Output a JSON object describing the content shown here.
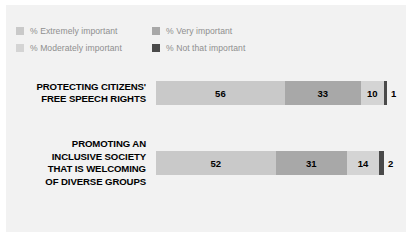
{
  "panel": {
    "background_color": "#f2f2f2"
  },
  "legend": {
    "rows": [
      [
        {
          "label": "% Extremely important",
          "color": "#c9c9c9",
          "swatch_name": "legend-swatch-extremely-important"
        },
        {
          "label": "% Very important",
          "color": "#a8a8a8",
          "swatch_name": "legend-swatch-very-important"
        }
      ],
      [
        {
          "label": "% Moderately important",
          "color": "#d4d4d4",
          "swatch_name": "legend-swatch-moderately-important"
        },
        {
          "label": "% Not that important",
          "color": "#4a4a4a",
          "swatch_name": "legend-swatch-not-that-important"
        }
      ]
    ]
  },
  "chart_data": {
    "type": "bar",
    "orientation": "horizontal",
    "stacked": true,
    "percent_scale": true,
    "title": "",
    "subtitle": "",
    "xlabel": "",
    "ylabel": "",
    "xlim": [
      0,
      100
    ],
    "grid": false,
    "legend_position": "top-left",
    "categories": [
      "PROTECTING CITIZENS' FREE SPEECH RIGHTS",
      "PROMOTING AN INCLUSIVE SOCIETY THAT IS WELCOMING OF DIVERSE GROUPS"
    ],
    "series": [
      {
        "name": "% Extremely important",
        "color": "#c9c9c9",
        "values": [
          56,
          52
        ]
      },
      {
        "name": "% Very important",
        "color": "#a8a8a8",
        "values": [
          33,
          31
        ]
      },
      {
        "name": "% Moderately important",
        "color": "#d4d4d4",
        "values": [
          10,
          14
        ]
      },
      {
        "name": "% Not that important",
        "color": "#4a4a4a",
        "values": [
          1,
          2
        ]
      }
    ]
  },
  "bars": [
    {
      "label_lines": [
        "PROTECTING CITIZENS'",
        "FREE SPEECH RIGHTS"
      ],
      "segments": [
        {
          "value": 56,
          "label": "56",
          "color": "#c9c9c9",
          "series": "% Extremely important"
        },
        {
          "value": 33,
          "label": "33",
          "color": "#a8a8a8",
          "series": "% Very important"
        },
        {
          "value": 10,
          "label": "10",
          "color": "#d4d4d4",
          "series": "% Moderately important"
        },
        {
          "value": 1,
          "label": "1",
          "color": "#4a4a4a",
          "series": "% Not that important"
        }
      ]
    },
    {
      "label_lines": [
        "PROMOTING AN",
        "INCLUSIVE SOCIETY",
        "THAT IS WELCOMING",
        "OF DIVERSE GROUPS"
      ],
      "segments": [
        {
          "value": 52,
          "label": "52",
          "color": "#c9c9c9",
          "series": "% Extremely important"
        },
        {
          "value": 31,
          "label": "31",
          "color": "#a8a8a8",
          "series": "% Very important"
        },
        {
          "value": 14,
          "label": "14",
          "color": "#d4d4d4",
          "series": "% Moderately important"
        },
        {
          "value": 2,
          "label": "2",
          "color": "#4a4a4a",
          "series": "% Not that important"
        }
      ]
    }
  ]
}
